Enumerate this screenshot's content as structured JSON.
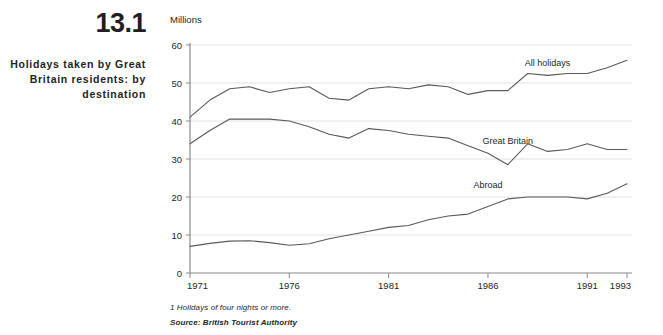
{
  "figure": {
    "number": "13.1",
    "title": "Holidays taken by Great Britain residents: by destination"
  },
  "footnote": "1 Holidays of four nights or more.",
  "source": "Source: British Tourist Authority",
  "colors": {
    "line": "#595959",
    "grid": "#e2e2e2",
    "axis": "#8a8a8a",
    "text": "#231f20"
  },
  "chart_data": {
    "type": "line",
    "title": "Holidays taken by Great Britain residents: by destination",
    "xlabel": "",
    "ylabel": "Millions",
    "unit_label": "Millions",
    "xlim": [
      1971,
      1993
    ],
    "ylim": [
      0,
      60
    ],
    "ytick_labels": [
      "0",
      "10",
      "20",
      "30",
      "40",
      "50",
      "60"
    ],
    "yticks": [
      0,
      10,
      20,
      30,
      40,
      50,
      60
    ],
    "xtick_labels": [
      "1971",
      "1976",
      "1981",
      "1986",
      "1991",
      "1993"
    ],
    "xticks": [
      1971,
      1976,
      1981,
      1986,
      1991,
      1993
    ],
    "grid": "horizontal",
    "legend_position": "inline-labels",
    "x": [
      1971,
      1972,
      1973,
      1974,
      1975,
      1976,
      1977,
      1978,
      1979,
      1980,
      1981,
      1982,
      1983,
      1984,
      1985,
      1986,
      1987,
      1988,
      1989,
      1990,
      1991,
      1992,
      1993
    ],
    "series": [
      {
        "name": "All holidays",
        "label": "All holidays",
        "label_x": 1989,
        "label_y": 54.5,
        "values": [
          41.0,
          45.5,
          48.5,
          49.0,
          47.5,
          48.5,
          49.0,
          46.0,
          45.5,
          48.5,
          49.0,
          48.5,
          49.5,
          49.0,
          47.0,
          48.0,
          48.0,
          52.5,
          52.0,
          52.5,
          52.5,
          54.0,
          56.0
        ]
      },
      {
        "name": "Great Britain",
        "label": "Great Britain",
        "label_x": 1987,
        "label_y": 34.0,
        "values": [
          34.0,
          37.5,
          40.5,
          40.5,
          40.5,
          40.0,
          38.5,
          36.5,
          35.5,
          38.0,
          37.5,
          36.5,
          36.0,
          35.5,
          33.5,
          31.5,
          28.5,
          34.0,
          32.0,
          32.5,
          34.0,
          32.5,
          32.5
        ]
      },
      {
        "name": "Abroad",
        "label": "Abroad",
        "label_x": 1986,
        "label_y": 22.5,
        "values": [
          7.0,
          7.8,
          8.4,
          8.5,
          8.0,
          7.3,
          7.7,
          9.0,
          10.0,
          11.0,
          12.0,
          12.5,
          14.0,
          15.0,
          15.5,
          17.5,
          19.5,
          20.0,
          20.0,
          20.0,
          19.5,
          21.0,
          23.5
        ]
      }
    ]
  }
}
